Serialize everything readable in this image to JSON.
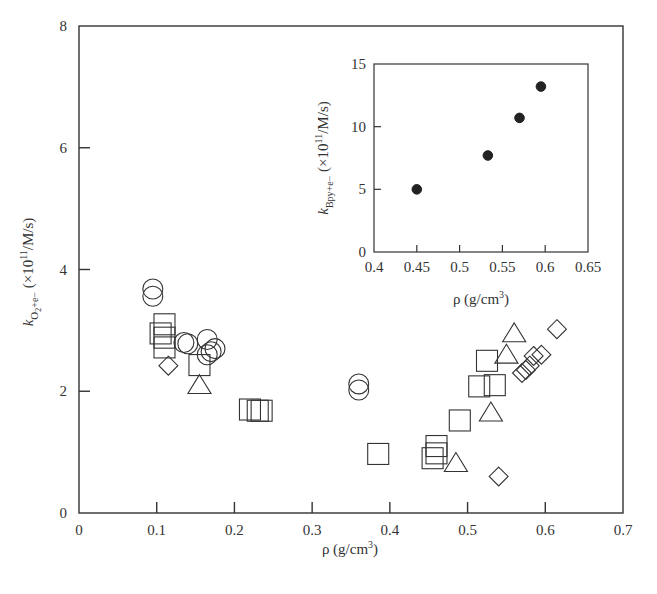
{
  "chart_data": [
    {
      "type": "scatter",
      "title": "",
      "xlabel": "ρ (g/cm³)",
      "ylabel": "k_{O2+e−} (×10^11/M/s)",
      "xlim": [
        0,
        0.7
      ],
      "ylim": [
        0,
        8
      ],
      "xticks": [
        "0",
        "0.1",
        "0.2",
        "0.3",
        "0.4",
        "0.5",
        "0.6",
        "0.7"
      ],
      "yticks": [
        "0",
        "2",
        "4",
        "6",
        "8"
      ],
      "grid": false,
      "legend": null,
      "series": [
        {
          "name": "circles",
          "marker": "circle",
          "points": [
            [
              0.095,
              3.68
            ],
            [
              0.095,
              3.56
            ],
            [
              0.135,
              2.8
            ],
            [
              0.14,
              2.78
            ],
            [
              0.165,
              2.85
            ],
            [
              0.17,
              2.65
            ],
            [
              0.175,
              2.7
            ],
            [
              0.165,
              2.6
            ],
            [
              0.36,
              2.12
            ],
            [
              0.36,
              2.02
            ]
          ]
        },
        {
          "name": "squares",
          "marker": "square",
          "points": [
            [
              0.11,
              3.1
            ],
            [
              0.105,
              2.95
            ],
            [
              0.11,
              2.88
            ],
            [
              0.11,
              2.72
            ],
            [
              0.155,
              2.43
            ],
            [
              0.22,
              1.7
            ],
            [
              0.235,
              1.68
            ],
            [
              0.23,
              1.68
            ],
            [
              0.385,
              0.97
            ],
            [
              0.46,
              1.1
            ],
            [
              0.46,
              0.98
            ],
            [
              0.455,
              0.9
            ],
            [
              0.49,
              1.52
            ],
            [
              0.515,
              2.08
            ],
            [
              0.525,
              2.5
            ],
            [
              0.535,
              2.1
            ]
          ]
        },
        {
          "name": "diamonds",
          "marker": "diamond",
          "points": [
            [
              0.115,
              2.42
            ],
            [
              0.54,
              0.6
            ],
            [
              0.57,
              2.3
            ],
            [
              0.575,
              2.35
            ],
            [
              0.58,
              2.42
            ],
            [
              0.585,
              2.58
            ],
            [
              0.595,
              2.6
            ],
            [
              0.615,
              3.02
            ]
          ]
        },
        {
          "name": "triangles",
          "marker": "triangle",
          "points": [
            [
              0.155,
              2.1
            ],
            [
              0.485,
              0.82
            ],
            [
              0.53,
              1.65
            ],
            [
              0.55,
              2.6
            ],
            [
              0.56,
              2.95
            ]
          ]
        }
      ]
    },
    {
      "type": "scatter",
      "title": "inset",
      "xlabel": "ρ (g/cm³)",
      "ylabel": "k_{Bpy+e−} (×10^11/M/s)",
      "xlim": [
        0.4,
        0.65
      ],
      "ylim": [
        0,
        15
      ],
      "xticks": [
        "0.4",
        "0.45",
        "0.5",
        "0.55",
        "0.6",
        "0.65"
      ],
      "yticks": [
        "0",
        "5",
        "10",
        "15"
      ],
      "grid": false,
      "series": [
        {
          "name": "filled circles",
          "marker": "filled-circle",
          "points": [
            [
              0.45,
              5.0
            ],
            [
              0.533,
              7.7
            ],
            [
              0.57,
              10.7
            ],
            [
              0.595,
              13.2
            ]
          ]
        }
      ]
    }
  ],
  "labels": {
    "main_x": "ρ (g/cm",
    "main_x_sup": "3",
    "main_x_end": ")",
    "main_y_k": "k",
    "main_y_sub": "O",
    "main_y_sub2": "2",
    "main_y_sub3": "+e−",
    "main_y_rest": " (×10",
    "main_y_sup": "11",
    "main_y_end": "/M/s)",
    "inset_y_k": "k",
    "inset_y_sub": "Bpy+e−",
    "inset_y_rest": " (×10",
    "inset_y_sup": "11",
    "inset_y_end": "/M/s)"
  },
  "colors": {
    "stroke": "#333333",
    "fill": "#222222",
    "background": "#ffffff"
  }
}
